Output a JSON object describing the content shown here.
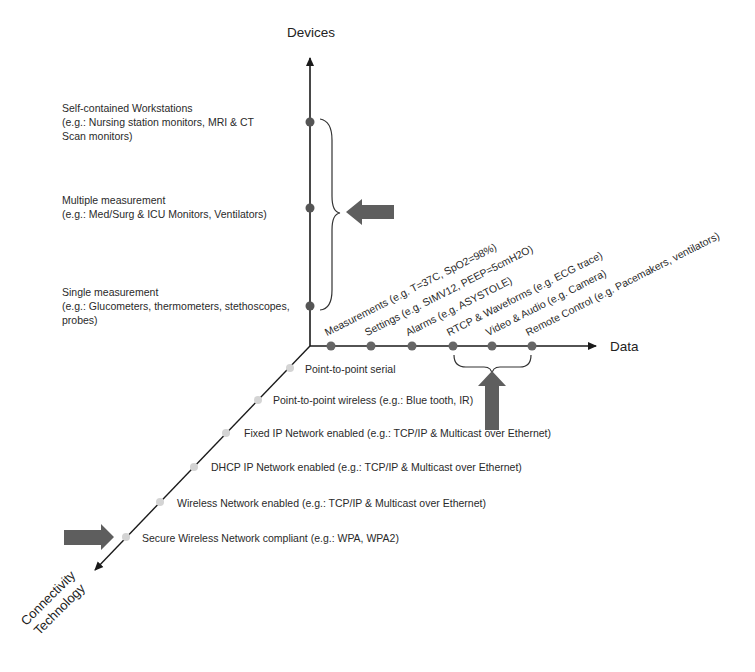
{
  "axes": {
    "devices": {
      "label": "Devices"
    },
    "data": {
      "label": "Data"
    },
    "connectivity": {
      "label_line1": "Connectivity",
      "label_line2": "Technology"
    }
  },
  "devices_levels": [
    {
      "title": "Self-contained Workstations",
      "line2": "(e.g.: Nursing station monitors, MRI & CT",
      "line3": "Scan monitors)"
    },
    {
      "title": "Multiple measurement",
      "line2": "(e.g.: Med/Surg & ICU Monitors, Ventilators)"
    },
    {
      "title": "Single measurement",
      "line2": "(e.g.: Glucometers, thermometers, stethoscopes,",
      "line3": "probes)"
    }
  ],
  "data_levels": [
    {
      "label": "Measurements (e.g. T=37C, SpO2=98%)"
    },
    {
      "label": "Settings (e.g. SIMV12, PEEP=5cmH2O)"
    },
    {
      "label": "Alarms (e.g. ASYSTOLE)"
    },
    {
      "label": "RTCP & Waveforms (e.g. ECG trace)"
    },
    {
      "label": "Video & Audio (e.g. Camera)"
    },
    {
      "label": "Remote Control (e.g. Pacemakers, ventilators)"
    }
  ],
  "connectivity_levels": [
    {
      "label": "Point-to-point serial"
    },
    {
      "label": "Point-to-point wireless (e.g.: Blue tooth, IR)"
    },
    {
      "label": "Fixed IP Network enabled (e.g.: TCP/IP & Multicast over Ethernet)"
    },
    {
      "label": "DHCP IP Network enabled (e.g.: TCP/IP & Multicast over Ethernet)"
    },
    {
      "label": "Wireless Network enabled (e.g.: TCP/IP & Multicast over Ethernet)"
    },
    {
      "label": "Secure Wireless Network compliant (e.g.: WPA, WPA2)"
    }
  ],
  "colors": {
    "axis": "#1a1a1a",
    "dot_dark": "#555555",
    "dot_light": "#d4d4d4",
    "arrow_fill": "#5e5e5e",
    "text": "#2a2a2a"
  }
}
